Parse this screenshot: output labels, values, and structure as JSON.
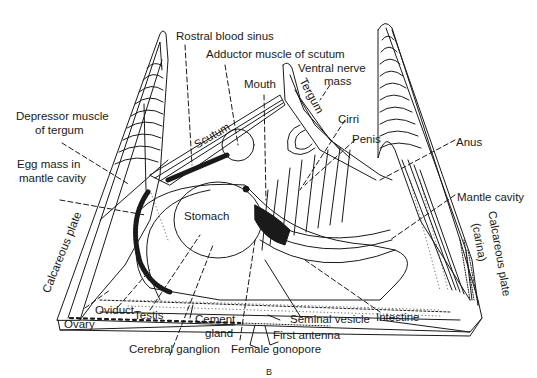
{
  "figure": {
    "panel_label": "B",
    "ink_color": "#1a1a1a",
    "background": "#ffffff"
  },
  "labels": {
    "rostral_blood_sinus": "Rostral blood sinus",
    "adductor_muscle": "Adductor muscle of scutum",
    "mouth": "Mouth",
    "ventral_nerve_1": "Ventral nerve",
    "ventral_nerve_2": "mass",
    "tergum": "Tergum",
    "cirri": "Cirri",
    "penis": "Penis",
    "anus": "Anus",
    "mantle_cavity": "Mantle cavity",
    "calcareous_carina_1": "Calcareous plate",
    "calcareous_carina_2": "(carina)",
    "depressor_1": "Depressor muscle",
    "depressor_2": "of tergum",
    "egg_mass_1": "Egg mass in",
    "egg_mass_2": "mantle cavity",
    "scutum": "Scutum",
    "stomach": "Stomach",
    "calcareous_plate": "Calcareous plate",
    "ovary": "Ovary",
    "oviduct": "Oviduct",
    "testis": "Testis",
    "cement_gland_1": "Cement",
    "cement_gland_2": "gland",
    "cerebral_ganglion": "Cerebral ganglion",
    "female_gonopore": "Female gonopore",
    "first_antenna": "First antenna",
    "seminal_vesicle": "Seminal vesicle",
    "intestine": "Intestine"
  }
}
